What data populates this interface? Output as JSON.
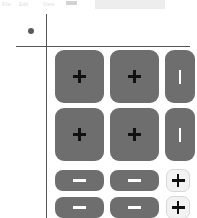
{
  "window": {
    "width": 197,
    "height": 218,
    "background": "#ffffff"
  },
  "toolbar": {
    "item_1": "File",
    "item_2": "Edit",
    "item_3": "View",
    "chip_label": "",
    "field_value": "",
    "field_placeholder": "Search"
  },
  "plot": {
    "vertical_axis_label": "",
    "horizontal_axis_label": "",
    "marker_label": ""
  },
  "colors": {
    "button_dark": "#6e6e6e",
    "button_light": "#f2f2f2",
    "glyph_dark": "#111111",
    "glyph_light": "#ffffff",
    "axis": "#555555",
    "marker": "#5a5a5a",
    "toolbar_field": "#ededed"
  },
  "buttons": {
    "rows": [
      {
        "row_index": 1,
        "cells": [
          {
            "id": "r1c1",
            "icon": "plus-icon",
            "label": "+",
            "style": "dark",
            "shape": "large-square"
          },
          {
            "id": "r1c2",
            "icon": "plus-icon",
            "label": "+",
            "style": "dark",
            "shape": "large-square"
          },
          {
            "id": "r1c3",
            "icon": "vertical-bar-icon",
            "label": "|",
            "style": "dark",
            "shape": "narrow-tall"
          }
        ]
      },
      {
        "row_index": 2,
        "cells": [
          {
            "id": "r2c1",
            "icon": "plus-icon",
            "label": "+",
            "style": "dark",
            "shape": "large-square"
          },
          {
            "id": "r2c2",
            "icon": "plus-icon",
            "label": "+",
            "style": "dark",
            "shape": "large-square"
          },
          {
            "id": "r2c3",
            "icon": "vertical-bar-icon",
            "label": "|",
            "style": "dark",
            "shape": "narrow-tall"
          }
        ]
      },
      {
        "row_index": 3,
        "cells": [
          {
            "id": "r3c1",
            "icon": "minus-icon",
            "label": "−",
            "style": "dark",
            "shape": "wide-short"
          },
          {
            "id": "r3c2",
            "icon": "minus-icon",
            "label": "−",
            "style": "dark",
            "shape": "wide-short"
          },
          {
            "id": "r3c3",
            "icon": "plus-icon",
            "label": "+",
            "style": "light",
            "shape": "small-square"
          }
        ]
      },
      {
        "row_index": 4,
        "cells": [
          {
            "id": "r4c1",
            "icon": "minus-icon",
            "label": "−",
            "style": "dark",
            "shape": "wide-short"
          },
          {
            "id": "r4c2",
            "icon": "minus-icon",
            "label": "−",
            "style": "dark",
            "shape": "wide-short"
          },
          {
            "id": "r4c3",
            "icon": "plus-icon",
            "label": "+",
            "style": "light",
            "shape": "small-square"
          }
        ]
      }
    ]
  }
}
